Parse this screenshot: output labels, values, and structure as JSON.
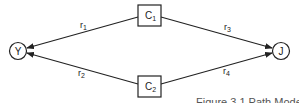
{
  "diagram": {
    "nodes": [
      {
        "id": "Y",
        "label": "Y",
        "shape": "circle"
      },
      {
        "id": "J",
        "label": "J",
        "shape": "circle"
      },
      {
        "id": "C1",
        "label": "C",
        "subscript": "1",
        "shape": "box"
      },
      {
        "id": "C2",
        "label": "C",
        "subscript": "2",
        "shape": "box"
      }
    ],
    "edges": [
      {
        "from": "C1",
        "to": "Y",
        "label": "r",
        "subscript": "1"
      },
      {
        "from": "C2",
        "to": "Y",
        "label": "r",
        "subscript": "2"
      },
      {
        "from": "C1",
        "to": "J",
        "label": "r",
        "subscript": "3"
      },
      {
        "from": "C2",
        "to": "J",
        "label": "r",
        "subscript": "4"
      }
    ],
    "caption": "Figure 3.1  Path Model"
  },
  "colors": {
    "stroke": "#222222",
    "background": "#ffffff"
  }
}
